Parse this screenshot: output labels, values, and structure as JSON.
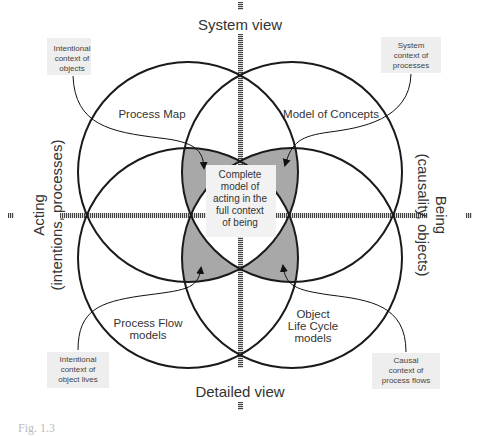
{
  "diagram": {
    "axes": {
      "top": "System view",
      "bottom": "Detailed view",
      "left_line1": "Acting",
      "left_line2": "(intentions, processes)",
      "right_line1": "Being",
      "right_line2": "(causality, objects)"
    },
    "regions": {
      "top_left": "Process Map",
      "top_right": "Model of Concepts",
      "bottom_left_line1": "Process Flow",
      "bottom_left_line2": "models",
      "bottom_right_line1": "Object",
      "bottom_right_line2": "Life Cycle",
      "bottom_right_line3": "models",
      "center_line1": "Complete",
      "center_line2": "model of",
      "center_line3": "acting in the",
      "center_line4": "full context",
      "center_line5": "of being"
    },
    "callouts": {
      "top_left": [
        "Intentional",
        "context of",
        "objects"
      ],
      "top_right": [
        "System",
        "context of",
        "processes"
      ],
      "bottom_left": [
        "Intentional",
        "context of",
        "object lives"
      ],
      "bottom_right": [
        "Causal",
        "context of",
        "process flows"
      ]
    },
    "colors": {
      "line": "#1a1a1a",
      "shaded": "#a8a8a8",
      "callout_bg": "#eeeeee",
      "axis": "#555555"
    },
    "caption": "Fig. 1.3"
  }
}
